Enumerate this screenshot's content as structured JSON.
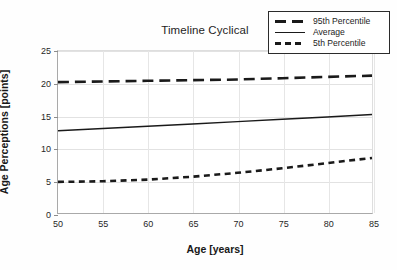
{
  "chart_data": {
    "type": "line",
    "title": "Timeline Cyclical",
    "xlabel": "Age [years]",
    "ylabel": "Age Perceptions [points]",
    "xlim": [
      50,
      85
    ],
    "ylim": [
      0,
      25
    ],
    "xticks": [
      50,
      55,
      60,
      65,
      70,
      75,
      80,
      85
    ],
    "yticks": [
      0,
      5,
      10,
      15,
      20,
      25
    ],
    "grid": true,
    "legend_position": "top-right",
    "x": [
      50,
      55,
      60,
      65,
      70,
      75,
      80,
      85
    ],
    "series": [
      {
        "name": "95th Percentile",
        "style": "long-dashed",
        "color": "#1a1a1a",
        "values": [
          20.2,
          20.3,
          20.4,
          20.5,
          20.6,
          20.8,
          21.0,
          21.2
        ]
      },
      {
        "name": "Average",
        "style": "solid",
        "color": "#1a1a1a",
        "values": [
          12.7,
          13.05,
          13.4,
          13.75,
          14.1,
          14.45,
          14.8,
          15.2
        ]
      },
      {
        "name": "5th Percentile",
        "style": "short-dashed",
        "color": "#1a1a1a",
        "values": [
          4.8,
          4.9,
          5.15,
          5.6,
          6.2,
          6.9,
          7.7,
          8.5
        ]
      }
    ]
  },
  "legend": {
    "items": [
      {
        "label": "95th Percentile"
      },
      {
        "label": "Average"
      },
      {
        "label": "5th Percentile"
      }
    ]
  },
  "colors": {
    "ink": "#1a1a1a",
    "grid": "#e2e2e2",
    "axis": "#a9a9a9",
    "background": "#ffffff"
  }
}
